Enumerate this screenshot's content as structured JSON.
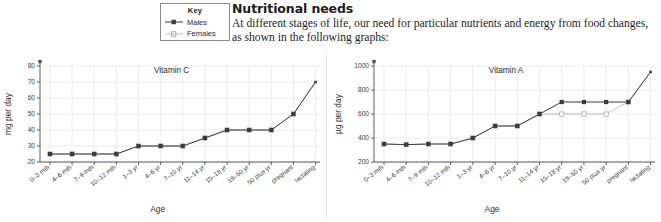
{
  "key": {
    "title": "Key",
    "entries": [
      {
        "label": "Males",
        "color": "#3b3b3b",
        "marker": "filled-square"
      },
      {
        "label": "Females",
        "color": "#b9b9b9",
        "marker": "open-square"
      }
    ]
  },
  "article": {
    "heading": "Nutritional needs",
    "paragraph": "At different stages of life, our need for particular nutrients and energy from food changes, as shown in the following graphs:"
  },
  "chart_data": [
    {
      "type": "line",
      "title": "Vitamin C",
      "xlabel": "Age",
      "ylabel": "mg per day",
      "ylim": [
        20,
        80
      ],
      "yticks": [
        20,
        30,
        40,
        50,
        60,
        70,
        80
      ],
      "grid": true,
      "legend": "external-key",
      "categories": [
        "0–3 mth",
        "4–6 mth",
        "7–9 mth",
        "10–12 mth",
        "1–3 yr",
        "4–6 yr",
        "7–10 yr",
        "11–14 yr",
        "15–18 yr",
        "19–50 yr",
        "50 plus yr",
        "pregnant",
        "lactating"
      ],
      "series": [
        {
          "name": "Males",
          "color": "#3b3b3b",
          "values": [
            25,
            25,
            25,
            25,
            30,
            30,
            30,
            35,
            40,
            40,
            40,
            50,
            70
          ]
        },
        {
          "name": "Females",
          "color": "#b9b9b9",
          "values": [
            25,
            25,
            25,
            25,
            30,
            30,
            30,
            35,
            40,
            40,
            40,
            50,
            70
          ]
        }
      ]
    },
    {
      "type": "line",
      "title": "Vitamin A",
      "xlabel": "Age",
      "ylabel": "µg per day",
      "ylim": [
        200,
        1000
      ],
      "yticks": [
        200,
        400,
        600,
        800,
        1000
      ],
      "grid": true,
      "legend": "external-key",
      "categories": [
        "0–3 mth",
        "4–6 mth",
        "7–9 mth",
        "10–12 mth",
        "1–3 yr",
        "4–6 yr",
        "7–10 yr",
        "11–14 yr",
        "15–18 yr",
        "19–50 yr",
        "50 plus yr",
        "pregnant",
        "lactating"
      ],
      "series": [
        {
          "name": "Males",
          "color": "#3b3b3b",
          "values": [
            350,
            345,
            350,
            350,
            400,
            500,
            500,
            600,
            700,
            700,
            700,
            700,
            950
          ]
        },
        {
          "name": "Females",
          "color": "#b9b9b9",
          "values": [
            350,
            345,
            350,
            350,
            400,
            500,
            500,
            600,
            600,
            600,
            600,
            700,
            950
          ]
        }
      ]
    }
  ]
}
